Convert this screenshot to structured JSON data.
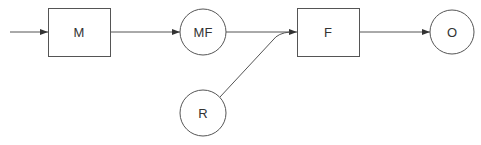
{
  "diagram": {
    "type": "flow",
    "nodes": [
      {
        "id": "M",
        "label": "M",
        "shape": "rect"
      },
      {
        "id": "MF",
        "label": "MF",
        "shape": "circle"
      },
      {
        "id": "F",
        "label": "F",
        "shape": "rect"
      },
      {
        "id": "O",
        "label": "O",
        "shape": "circle"
      },
      {
        "id": "R",
        "label": "R",
        "shape": "circle"
      }
    ],
    "edges": [
      {
        "from": "input",
        "to": "M"
      },
      {
        "from": "M",
        "to": "MF"
      },
      {
        "from": "MF",
        "to": "F"
      },
      {
        "from": "R",
        "to": "F"
      },
      {
        "from": "F",
        "to": "O"
      }
    ],
    "colors": {
      "stroke": "#555555",
      "text": "#333333",
      "background": "#ffffff"
    }
  }
}
